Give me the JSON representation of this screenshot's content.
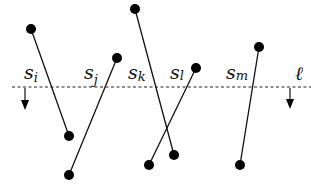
{
  "diagram": {
    "sweep_line": {
      "label": "ℓ",
      "direction": "down"
    },
    "segments": [
      {
        "id": "i",
        "label": "s",
        "subscript": "i"
      },
      {
        "id": "j",
        "label": "s",
        "subscript": "j"
      },
      {
        "id": "k",
        "label": "s",
        "subscript": "k"
      },
      {
        "id": "l",
        "label": "s",
        "subscript": "l"
      },
      {
        "id": "m",
        "label": "s",
        "subscript": "m"
      }
    ]
  }
}
